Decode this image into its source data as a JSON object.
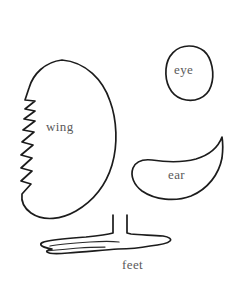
{
  "document": {
    "kind": "craft-pattern-template",
    "title": "Pattern pieces",
    "background_color": "#ffffff",
    "outline_color": "#1c1c1c",
    "label_color": "#5a5a5a"
  },
  "pieces": [
    {
      "id": "wing",
      "label": "wing",
      "icon": "wing-shape-icon",
      "description": "large leaf-like shape with serrated left edge",
      "serration_count": 6
    },
    {
      "id": "eye",
      "label": "eye",
      "icon": "eye-shape-icon",
      "description": "rounded oval"
    },
    {
      "id": "ear",
      "label": "ear",
      "icon": "ear-shape-icon",
      "description": "teardrop comma shape with point at upper right"
    },
    {
      "id": "feet",
      "label": "feet",
      "icon": "feet-shape-icon",
      "description": "elongated horizontal foot bar with two vertical stems"
    }
  ]
}
